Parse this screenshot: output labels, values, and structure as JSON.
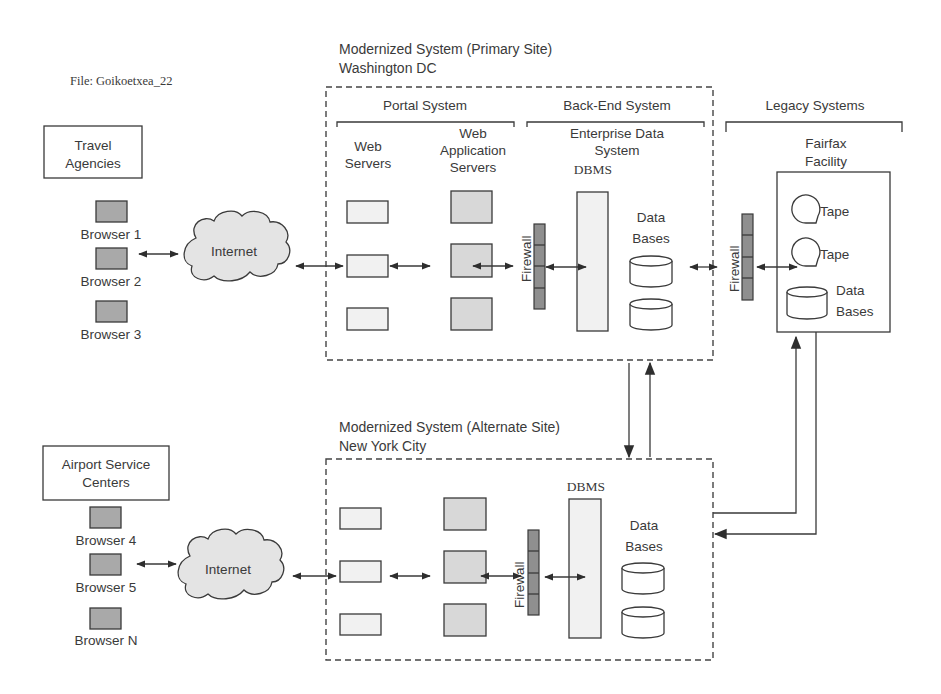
{
  "file_label": "File: Goikoetxea_22",
  "primary_site": {
    "title": "Modernized System (Primary Site)",
    "location": "Washington DC",
    "portal_system": "Portal System",
    "backend_system": "Back-End System",
    "web_servers": [
      "Web",
      "Servers"
    ],
    "web_app_servers": [
      "Web",
      "Application",
      "Servers"
    ],
    "enterprise_data_system": [
      "Enterprise Data",
      "System"
    ],
    "dbms": "DBMS",
    "firewall": "Firewall",
    "data_bases": [
      "Data",
      "Bases"
    ]
  },
  "legacy": {
    "title": "Legacy Systems",
    "facility": [
      "Fairfax",
      "Facility"
    ],
    "tape_1": "Tape",
    "tape_2": "Tape",
    "data_bases": [
      "Data",
      "Bases"
    ],
    "firewall": "Firewall"
  },
  "travel_agencies": {
    "title": [
      "Travel",
      "Agencies"
    ],
    "browsers": [
      "Browser 1",
      "Browser 2",
      "Browser 3"
    ],
    "internet": "Internet"
  },
  "alternate_site": {
    "title": "Modernized System (Alternate Site)",
    "location": "New York City",
    "dbms": "DBMS",
    "firewall": "Firewall",
    "data_bases": [
      "Data",
      "Bases"
    ]
  },
  "airport": {
    "title": [
      "Airport Service",
      "Centers"
    ],
    "browsers": [
      "Browser 4",
      "Browser 5",
      "Browser N"
    ],
    "internet": "Internet"
  }
}
